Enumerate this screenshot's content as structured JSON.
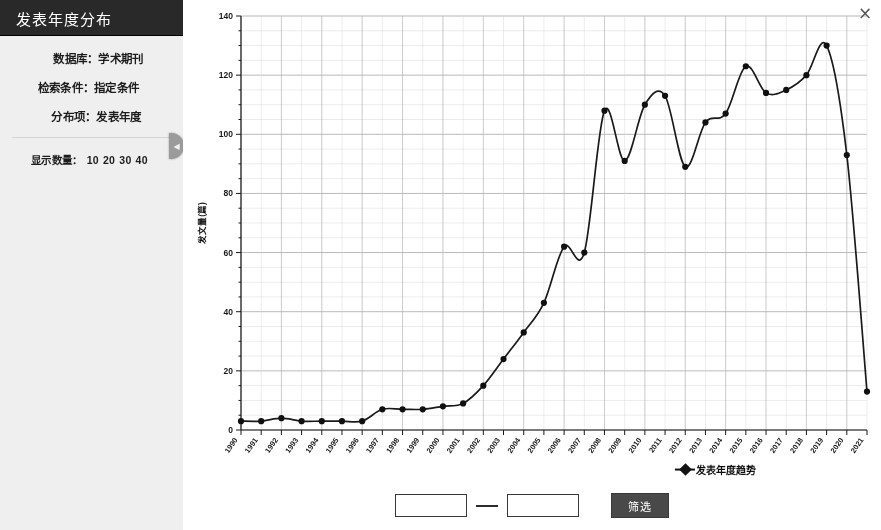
{
  "panel": {
    "title": "发表年度分布",
    "meta": [
      {
        "label": "数据库：学术期刊"
      },
      {
        "label": "检索条件：指定条件"
      },
      {
        "label": "分布项：发表年度"
      }
    ],
    "count_label": "显示数量：",
    "count_options": [
      "10",
      "20",
      "30",
      "40"
    ],
    "collapse_icon": "chevron-left-icon"
  },
  "window": {
    "close_icon": "close-icon",
    "close_label": "×"
  },
  "filter": {
    "start_value": "",
    "end_value": "",
    "start_placeholder": "",
    "end_placeholder": "",
    "separator": "—",
    "button_label": "筛选"
  },
  "legend": {
    "entries": [
      {
        "label": "发表年度趋势",
        "marker": "diamond",
        "color": "#141414"
      }
    ]
  },
  "chart_data": {
    "type": "line",
    "title": "",
    "xlabel": "",
    "ylabel": "发文量(篇)",
    "ylim": [
      0,
      140
    ],
    "ytick_step": 20,
    "yticks": [
      0,
      20,
      40,
      60,
      80,
      100,
      120,
      140
    ],
    "grid": true,
    "grid_minor_step": 5,
    "legend_position": "bottom",
    "marker": "circle",
    "line_color": "#1c1c1c",
    "categories": [
      "1990",
      "1991",
      "1992",
      "1993",
      "1994",
      "1995",
      "1996",
      "1997",
      "1998",
      "1999",
      "2000",
      "2001",
      "2002",
      "2003",
      "2004",
      "2005",
      "2006",
      "2007",
      "2008",
      "2009",
      "2010",
      "2011",
      "2012",
      "2013",
      "2014",
      "2015",
      "2016",
      "2017",
      "2018",
      "2019",
      "2020",
      "2021"
    ],
    "series": [
      {
        "name": "发表年度趋势",
        "values": [
          3,
          3,
          4,
          3,
          3,
          3,
          3,
          7,
          7,
          7,
          8,
          9,
          15,
          24,
          33,
          43,
          62,
          60,
          108,
          91,
          110,
          113,
          89,
          104,
          107,
          123,
          114,
          115,
          120,
          130,
          93,
          13
        ]
      }
    ]
  }
}
